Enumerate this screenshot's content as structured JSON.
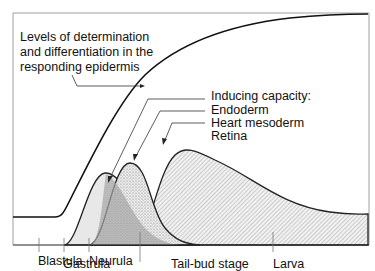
{
  "main_curve": {
    "label_lines": [
      "Levels of determination",
      "and differentiation in the",
      "responding epidermis"
    ]
  },
  "inducing": {
    "title": "Inducing capacity:",
    "items": [
      {
        "label": "Endoderm",
        "fill": "#e6e6e6"
      },
      {
        "label": "Heart mesoderm",
        "fill": "#cfcfcf"
      },
      {
        "label": "Retina",
        "fill": "#dcdcdc"
      }
    ]
  },
  "stages": [
    {
      "label": "Blastula"
    },
    {
      "label": "Gastrula"
    },
    {
      "label": "Neurula"
    },
    {
      "label": "Tail-bud stage"
    },
    {
      "label": "Larva"
    }
  ]
}
